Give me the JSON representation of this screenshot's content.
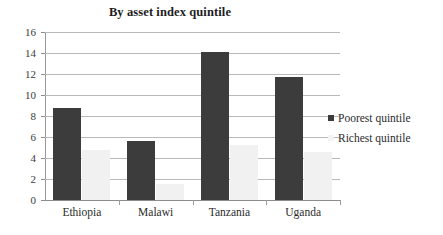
{
  "chart_data": {
    "type": "bar",
    "title": "By asset index quintile",
    "xlabel": "",
    "ylabel": "",
    "ylim": [
      0,
      16
    ],
    "ytick_step": 2,
    "yticks": [
      "16",
      "14",
      "12",
      "10",
      "8",
      "6",
      "4",
      "2",
      "0"
    ],
    "grid": true,
    "legend_position": "right",
    "categories": [
      "Ethiopia",
      "Malawi",
      "Tanzania",
      "Uganda"
    ],
    "series": [
      {
        "name": "Poorest quintile",
        "color": "#3c3c3c",
        "values": [
          8.8,
          5.6,
          14.1,
          11.7
        ]
      },
      {
        "name": "Richest quintile",
        "color": "#f1f1f1",
        "values": [
          4.8,
          1.5,
          5.2,
          4.6
        ]
      }
    ]
  },
  "legend": {
    "entries": [
      {
        "label": "Poorest quintile"
      },
      {
        "label": "Richest quintile"
      }
    ]
  },
  "axis": {
    "y_labels": [
      "16",
      "14",
      "12",
      "10",
      "8",
      "6",
      "4",
      "2",
      "0"
    ],
    "x_labels": [
      "Ethiopia",
      "Malawi",
      "Tanzania",
      "Uganda"
    ]
  }
}
